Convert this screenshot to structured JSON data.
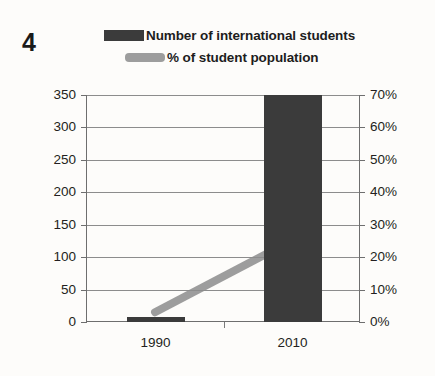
{
  "question_number": "4",
  "legend": {
    "entries": [
      {
        "label": "Number of international students",
        "swatch": "bar-swatch",
        "color": "#3b3b3b"
      },
      {
        "label": "% of student population",
        "swatch": "line-swatch",
        "color": "#9d9d9d"
      }
    ]
  },
  "chart_data": {
    "type": "bar",
    "title": "",
    "subtitle": "",
    "xlabel": "",
    "ylabel": "",
    "categories": [
      "1990",
      "2010"
    ],
    "series": [
      {
        "name": "Number of international students",
        "type": "bar",
        "axis": "left",
        "values": [
          7,
          350
        ],
        "color": "#3b3b3b"
      },
      {
        "name": "% of student population",
        "type": "line",
        "axis": "right",
        "values": [
          3,
          25
        ],
        "color": "#9d9d9d"
      }
    ],
    "axes": {
      "left": {
        "ticks": [
          "350",
          "300",
          "250",
          "200",
          "150",
          "100",
          "50",
          "0"
        ],
        "values": [
          350,
          300,
          250,
          200,
          150,
          100,
          50,
          0
        ],
        "ylim": [
          0,
          350
        ],
        "step": 50
      },
      "right": {
        "ticks": [
          "70%",
          "60%",
          "50%",
          "40%",
          "30%",
          "20%",
          "10%",
          "0%"
        ],
        "values": [
          70,
          60,
          50,
          40,
          30,
          20,
          10,
          0
        ],
        "ylim": [
          0,
          70
        ],
        "step": 10
      }
    },
    "grid": true,
    "legend_position": "top"
  }
}
